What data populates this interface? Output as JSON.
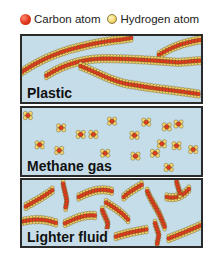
{
  "legend": {
    "items": [
      {
        "label": "Carbon atom",
        "icon": "carbon-atom-icon",
        "color": "#e23a1e"
      },
      {
        "label": "Hydrogen atom",
        "icon": "hydrogen-atom-icon",
        "color": "#f5d66a"
      }
    ]
  },
  "panels": [
    {
      "id": "plastic",
      "label": "Plastic",
      "description": "long tangled polymer chains"
    },
    {
      "id": "methane",
      "label": "Methane gas",
      "description": "small separated molecules"
    },
    {
      "id": "lighter",
      "label": "Lighter fluid",
      "description": "short chain molecules"
    }
  ],
  "colors": {
    "panel_background": "#c5dde9",
    "panel_border": "#2a2a2a",
    "carbon": "#e23a1e",
    "hydrogen": "#f5d66a"
  }
}
